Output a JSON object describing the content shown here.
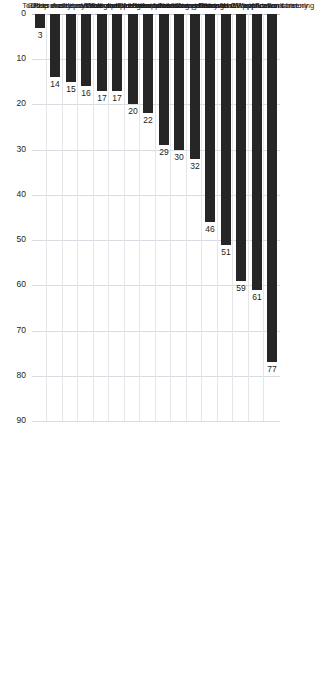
{
  "chart_data": {
    "type": "bar",
    "title": "",
    "subtitle": "",
    "xlabel": "",
    "ylabel": "",
    "orientation": "vertical",
    "grid": true,
    "legend": null,
    "ylim": [
      0,
      90
    ],
    "yticks": [
      "0",
      "10",
      "20",
      "30",
      "40",
      "50",
      "60",
      "70",
      "80",
      "90"
    ],
    "categories": [
      "Previous work history",
      "Through CV/application screening",
      "Educational qualifications",
      "Competency-based interviews",
      "Interviews following contents of CV/application form",
      "Values-based interviews",
      "Pre-application assessment",
      "Strengths based interviews",
      "Verbal and/or numerical reasoning tests",
      "Other aptitude assessments",
      "Work-sample tests",
      "Personality/psychological questionnaires",
      "Assessment centres",
      "Tools to enable self-selection",
      "Group exercises",
      "Other"
    ],
    "values": [
      77,
      61,
      59,
      51,
      46,
      32,
      30,
      29,
      22,
      20,
      17,
      17,
      16,
      15,
      14,
      3
    ],
    "data_labels": [
      "77",
      "61",
      "59",
      "51",
      "46",
      "32",
      "30",
      "29",
      "22",
      "20",
      "17",
      "17",
      "16",
      "15",
      "14",
      "3"
    ],
    "colors": {
      "bar": "#262626",
      "grid": "#d9dce3",
      "text": "#231f20",
      "background": "#ffffff"
    }
  }
}
